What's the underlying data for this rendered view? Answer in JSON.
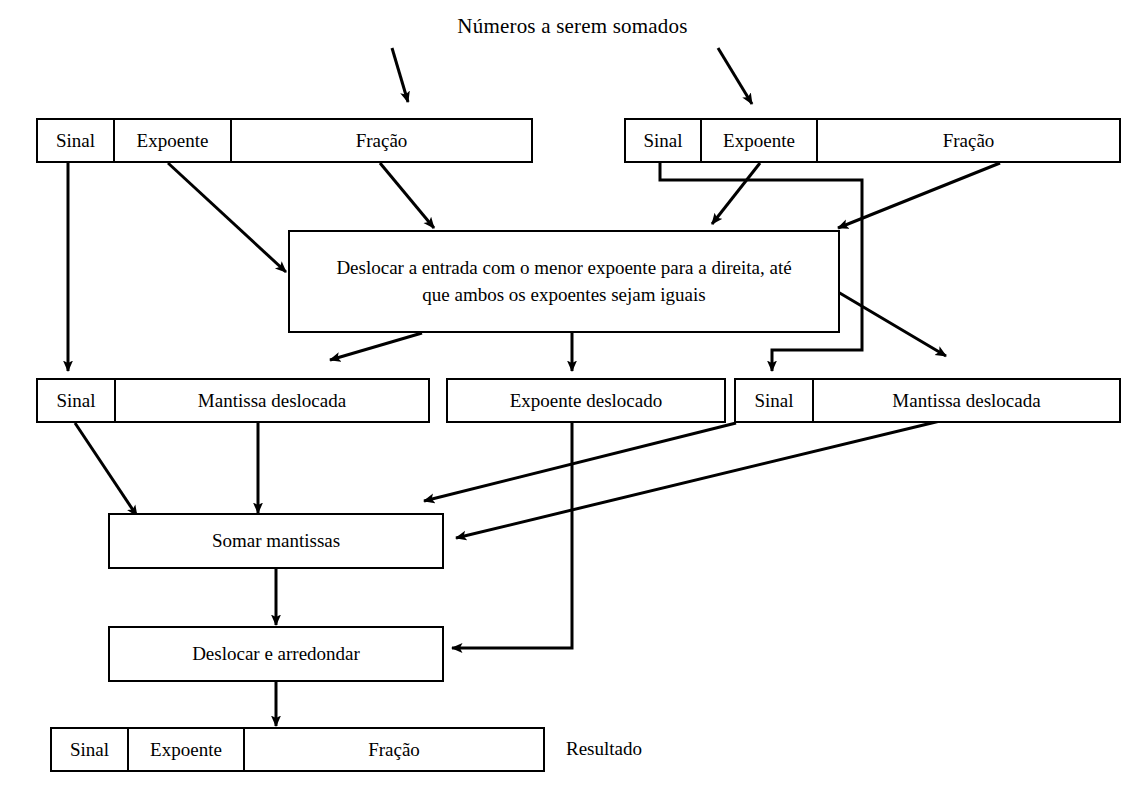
{
  "diagram": {
    "title": "Números a serem somados",
    "result_label": "Resultado",
    "operand_left": {
      "sign": "Sinal",
      "exponent": "Expoente",
      "fraction": "Fração"
    },
    "operand_right": {
      "sign": "Sinal",
      "exponent": "Expoente",
      "fraction": "Fração"
    },
    "align_box": "Deslocar a entrada com o menor expoente para a direita, até que ambos os expoentes sejam iguais",
    "shifted_left": {
      "sign": "Sinal",
      "mantissa": "Mantissa deslocada"
    },
    "shifted_exponent": "Expoente deslocado",
    "shifted_right": {
      "sign": "Sinal",
      "mantissa": "Mantissa deslocada"
    },
    "add_box": "Somar mantissas",
    "round_box": "Deslocar e arredondar",
    "result": {
      "sign": "Sinal",
      "exponent": "Expoente",
      "fraction": "Fração"
    },
    "colors": {
      "stroke": "#000000",
      "background": "#ffffff"
    }
  }
}
